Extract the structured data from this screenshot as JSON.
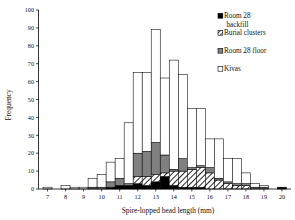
{
  "chart_data": {
    "type": "bar",
    "subtype": "stacked-histogram",
    "title": "",
    "xlabel": "Spire-lopped bead length (mm)",
    "ylabel": "Frequency",
    "xlim": [
      6.5,
      20.5
    ],
    "ylim": [
      0,
      100
    ],
    "ytick_step": 10,
    "grid": false,
    "legend_position": "top-right",
    "bin_width": 0.5,
    "x": [
      7,
      7.5,
      8,
      8.5,
      9,
      9.5,
      10,
      10.5,
      11,
      11.5,
      12,
      12.5,
      13,
      13.5,
      14,
      14.5,
      15,
      15.5,
      16,
      16.5,
      17,
      17.5,
      18,
      18.5,
      19,
      19.5,
      20
    ],
    "xticks": [
      7,
      8,
      9,
      10,
      11,
      12,
      13,
      14,
      15,
      16,
      17,
      18,
      19,
      20
    ],
    "yticks": [
      0,
      10,
      20,
      30,
      40,
      50,
      60,
      70,
      80,
      90,
      100
    ],
    "categories": [
      "7",
      "7.5",
      "8",
      "8.5",
      "9",
      "9.5",
      "10",
      "10.5",
      "11",
      "11.5",
      "12",
      "12.5",
      "13",
      "13.5",
      "14",
      "14.5",
      "15",
      "15.5",
      "16",
      "16.5",
      "17",
      "17.5",
      "18",
      "18.5",
      "19",
      "19.5",
      "20"
    ],
    "series": [
      {
        "name": "Room 28 backfill",
        "fill": "#000000",
        "pattern": "solid",
        "values": [
          0,
          0,
          0,
          0,
          0,
          0,
          0,
          1,
          2,
          2,
          3,
          2,
          4,
          7,
          2,
          1,
          1,
          1,
          0,
          0,
          0,
          0,
          0,
          0,
          0,
          0,
          1
        ]
      },
      {
        "name": "Burial clusters",
        "fill": "#ffffff",
        "pattern": "diagonal-hatch",
        "values": [
          0,
          0,
          0,
          0,
          0,
          0,
          0,
          0,
          0,
          0,
          4,
          5,
          4,
          2,
          8,
          9,
          10,
          11,
          9,
          5,
          3,
          2,
          2,
          0,
          0,
          0,
          0
        ]
      },
      {
        "name": "Room 28 floor",
        "fill": "#808080",
        "pattern": "solid",
        "values": [
          0,
          0,
          0,
          0,
          0,
          1,
          1,
          3,
          4,
          1,
          13,
          14,
          18,
          10,
          1,
          7,
          1,
          1,
          3,
          1,
          1,
          1,
          1,
          1,
          1,
          0,
          0
        ]
      },
      {
        "name": "Kivas",
        "fill": "#ffffff",
        "pattern": "solid",
        "values": [
          1,
          0,
          2,
          1,
          1,
          5,
          7,
          11,
          11,
          34,
          45,
          44,
          63,
          43,
          61,
          47,
          33,
          32,
          16,
          22,
          13,
          14,
          6,
          2,
          1,
          0,
          0
        ]
      }
    ],
    "totals": [
      1,
      0,
      2,
      1,
      1,
      6,
      8,
      15,
      17,
      37,
      65,
      65,
      89,
      62,
      72,
      64,
      45,
      45,
      28,
      28,
      17,
      17,
      9,
      3,
      2,
      0,
      1
    ]
  },
  "legend": {
    "items": [
      {
        "label_line1": "Room 28",
        "label_line2": "backfill",
        "swatch": "black-square"
      },
      {
        "label_line1": "Burial clusters",
        "label_line2": "",
        "swatch": "hatched-square"
      },
      {
        "label_line1": "Room 28 floor",
        "label_line2": "",
        "swatch": "gray-square"
      },
      {
        "label_line1": "Kivas",
        "label_line2": "",
        "swatch": "white-square"
      }
    ]
  },
  "colors": {
    "backfill": "#000000",
    "burial": "#ffffff",
    "floor": "#808080",
    "kivas": "#ffffff",
    "axis": "#000000"
  }
}
